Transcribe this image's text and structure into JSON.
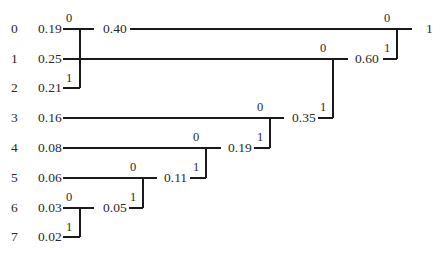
{
  "diagram": {
    "type": "huffman-code-tree",
    "rows_y": [
      29,
      59,
      88,
      118,
      148,
      178,
      208,
      237
    ],
    "symbols": [
      {
        "index": "0",
        "prob": "0.19"
      },
      {
        "index": "1",
        "prob": "0.25"
      },
      {
        "index": "2",
        "prob": "0.21"
      },
      {
        "index": "3",
        "prob": "0.16"
      },
      {
        "index": "4",
        "prob": "0.08"
      },
      {
        "index": "5",
        "prob": "0.06"
      },
      {
        "index": "6",
        "prob": "0.03"
      },
      {
        "index": "7",
        "prob": "0.02"
      }
    ],
    "merges": [
      {
        "id": "m1",
        "upper_row": 6,
        "lower_row": 7,
        "x": 80,
        "result": "0.05",
        "result_row": 6,
        "bit_upper": "0",
        "bit_lower": "1"
      },
      {
        "id": "m2",
        "upper_row": 5,
        "lower_row": 6,
        "x": 143,
        "result": "0.11",
        "result_row": 5,
        "bit_upper": "0",
        "bit_lower": "1"
      },
      {
        "id": "m3",
        "upper_row": 4,
        "lower_row": 5,
        "x": 206,
        "result": "0.19",
        "result_row": 4,
        "bit_upper": "0",
        "bit_lower": "1"
      },
      {
        "id": "m4",
        "upper_row": 3,
        "lower_row": 4,
        "x": 270,
        "result": "0.35",
        "result_row": 3,
        "bit_upper": "0",
        "bit_lower": "1"
      },
      {
        "id": "m5",
        "upper_row": 0,
        "lower_row": 2,
        "x": 80,
        "result": "0.40",
        "result_row": 0,
        "bit_upper": "0",
        "bit_lower": "1"
      },
      {
        "id": "m6",
        "upper_row": 1,
        "lower_row": 3,
        "x": 333,
        "result": "0.60",
        "result_row": 1,
        "bit_upper": "0",
        "bit_lower": "1"
      },
      {
        "id": "m7",
        "upper_row": 0,
        "lower_row": 1,
        "x": 397,
        "result": "1",
        "result_row": 0,
        "bit_upper": "0",
        "bit_lower": "1"
      }
    ],
    "line_color": "#1a1a1a",
    "text_color": "#2a2a2a"
  }
}
